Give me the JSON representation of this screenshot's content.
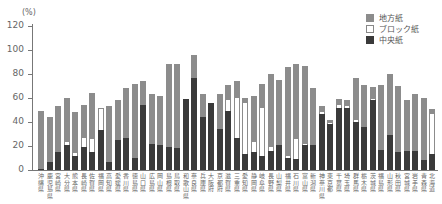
{
  "chart_data": {
    "type": "bar",
    "stacked": true,
    "title": "",
    "xlabel": "",
    "ylabel": "(%)",
    "ylim": [
      0,
      120
    ],
    "yticks": [
      0,
      20,
      40,
      60,
      80,
      100,
      120
    ],
    "grid": false,
    "legend_position": "top-right",
    "categories": [
      "沖縄県",
      "鹿児島県",
      "宮崎県",
      "大分県",
      "熊本県",
      "長崎県",
      "佐賀県",
      "福岡県",
      "高知県",
      "愛媛県",
      "香川県",
      "徳島県",
      "山口県",
      "広島県",
      "岡山県",
      "島根県",
      "鳥取県",
      "和歌山県",
      "奈良県",
      "兵庫県",
      "大阪府",
      "京都府",
      "滋賀県",
      "三重県",
      "愛知県",
      "静岡県",
      "岐阜県",
      "長野県",
      "山梨県",
      "福井県",
      "石川県",
      "富山県",
      "新潟県",
      "神奈川県",
      "東京都",
      "千葉県",
      "埼玉県",
      "群馬県",
      "栃木県",
      "茨城県",
      "福島県",
      "山形県",
      "秋田県",
      "宮城県",
      "岩手県",
      "青森県",
      "北海道"
    ],
    "series": [
      {
        "name": "中央紙",
        "color": "#3a3a3a",
        "values": [
          1,
          7,
          15,
          21,
          12,
          19,
          15,
          33,
          7,
          25,
          27,
          10,
          54,
          22,
          21,
          19,
          18,
          59,
          77,
          44,
          56,
          34,
          49,
          27,
          13,
          15,
          12,
          16,
          21,
          10,
          9,
          21,
          21,
          47,
          38,
          52,
          52,
          40,
          36,
          58,
          17,
          29,
          15,
          16,
          16,
          8,
          13
        ]
      },
      {
        "name": "ブロック紙",
        "color": "#ffffff",
        "values": [
          0,
          0,
          0,
          2,
          2,
          8,
          11,
          18,
          0,
          0,
          0,
          0,
          0,
          0,
          0,
          0,
          0,
          0,
          0,
          0,
          0,
          0,
          9,
          33,
          43,
          8,
          40,
          3,
          0,
          2,
          17,
          1,
          0,
          1,
          1,
          2,
          1,
          2,
          0,
          1,
          0,
          0,
          0,
          0,
          0,
          0,
          34
        ]
      },
      {
        "name": "地方紙",
        "color": "#8c8c8c",
        "values": [
          48,
          37,
          38,
          37,
          34,
          27,
          38,
          1,
          46,
          33,
          41,
          62,
          20,
          41,
          41,
          69,
          70,
          0,
          19,
          19,
          0,
          29,
          13,
          14,
          4,
          39,
          20,
          61,
          54,
          74,
          62,
          65,
          47,
          5,
          3,
          5,
          5,
          35,
          35,
          10,
          54,
          51,
          55,
          42,
          47,
          52,
          4
        ]
      }
    ]
  },
  "legend": {
    "items": [
      {
        "label": "地方紙",
        "color": "#8c8c8c"
      },
      {
        "label": "ブロック紙",
        "color": "#ffffff"
      },
      {
        "label": "中央紙",
        "color": "#3a3a3a"
      }
    ]
  },
  "axis": {
    "unit_label": "(%)",
    "ytick_labels": [
      "0",
      "20",
      "40",
      "60",
      "80",
      "100",
      "120"
    ]
  }
}
